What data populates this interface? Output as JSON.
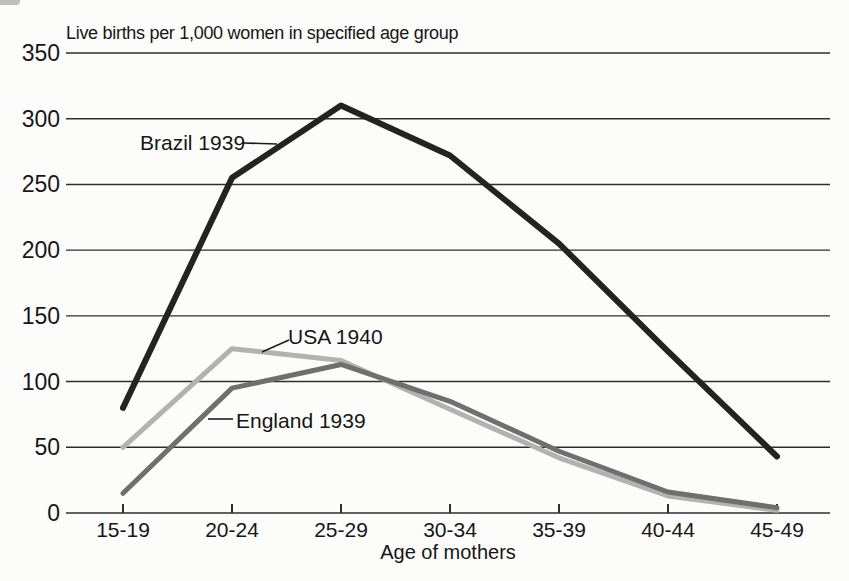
{
  "colors": {
    "background": "#fcfcfb",
    "text": "#161616",
    "grid": "#2e2e2e",
    "leader_line": "#1c1c1c"
  },
  "chart_data": {
    "type": "line",
    "title": "Live births per 1,000 women in specified age group",
    "xlabel": "Age of mothers",
    "ylabel": "",
    "categories": [
      "15-19",
      "20-24",
      "25-29",
      "30-34",
      "35-39",
      "40-44",
      "45-49"
    ],
    "ylim": [
      0,
      350
    ],
    "ytick_step": 50,
    "grid": true,
    "legend_position": "inline-annotations",
    "series": [
      {
        "name": "USA 1940",
        "color": "#b2b2b2",
        "stroke_width": 5,
        "values": [
          50,
          125,
          116,
          79,
          42,
          13,
          2
        ]
      },
      {
        "name": "England 1939",
        "color": "#6f6f6f",
        "stroke_width": 5,
        "values": [
          15,
          95,
          113,
          85,
          47,
          16,
          4
        ]
      },
      {
        "name": "Brazil 1939",
        "color": "#232323",
        "stroke_width": 6,
        "values": [
          80,
          255,
          310,
          272,
          205,
          123,
          43
        ]
      }
    ],
    "annotations": [
      {
        "text": "Brazil 1939",
        "text_x": 140,
        "text_y": 143,
        "leader": [
          243,
          143,
          277,
          144
        ]
      },
      {
        "text": "USA 1940",
        "text_x": 288,
        "text_y": 337,
        "leader": [
          262,
          352,
          289,
          340
        ]
      },
      {
        "text": "England 1939",
        "text_x": 236,
        "text_y": 421,
        "leader": [
          208,
          419,
          233,
          419
        ]
      }
    ]
  }
}
